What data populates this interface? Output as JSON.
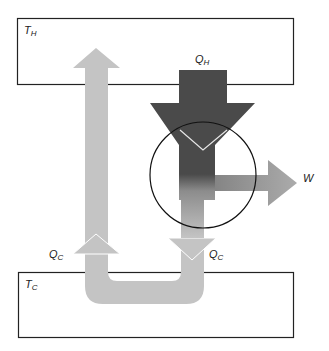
{
  "diagram": {
    "type": "heat-engine-energy-flow",
    "reservoirs": [
      {
        "id": "hot",
        "symbol": "T",
        "subscript": "H"
      },
      {
        "id": "cold",
        "symbol": "T",
        "subscript": "C"
      }
    ],
    "flows": [
      {
        "id": "qh",
        "symbol": "Q",
        "subscript": "H",
        "direction": "down"
      },
      {
        "id": "qc-out",
        "symbol": "Q",
        "subscript": "C",
        "direction": "down"
      },
      {
        "id": "qc-return",
        "symbol": "Q",
        "subscript": "C",
        "direction": "up"
      },
      {
        "id": "w",
        "symbol": "W",
        "direction": "right"
      }
    ],
    "colors": {
      "hot_flow": "#4a4a4a",
      "cold_flow": "#c4c4c4",
      "work_flow": "#a8a8a8",
      "box_stroke": "#222222",
      "circle_stroke": "#111111"
    }
  }
}
